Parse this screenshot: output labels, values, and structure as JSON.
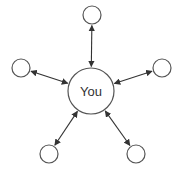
{
  "diagram": {
    "type": "hub-and-spoke",
    "center": {
      "label": "You",
      "cx": 91,
      "cy": 91,
      "r": 23
    },
    "satellites": [
      {
        "id": "top",
        "label": "",
        "cx": 92,
        "cy": 15,
        "r": 9
      },
      {
        "id": "left",
        "label": "",
        "cx": 21,
        "cy": 68,
        "r": 9
      },
      {
        "id": "right",
        "label": "",
        "cx": 162,
        "cy": 68,
        "r": 9
      },
      {
        "id": "bottom-left",
        "label": "",
        "cx": 49,
        "cy": 154,
        "r": 9
      },
      {
        "id": "bottom-right",
        "label": "",
        "cx": 136,
        "cy": 154,
        "r": 9
      }
    ],
    "edges": [
      {
        "from": "top",
        "to": "center",
        "arrows": "both"
      },
      {
        "from": "left",
        "to": "center",
        "arrows": "both"
      },
      {
        "from": "right",
        "to": "center",
        "arrows": "both"
      },
      {
        "from": "bottom-left",
        "to": "center",
        "arrows": "both"
      },
      {
        "from": "bottom-right",
        "to": "center",
        "arrows": "both"
      }
    ],
    "colors": {
      "stroke": "#555555",
      "edge": "#333333",
      "background": "#ffffff"
    }
  }
}
